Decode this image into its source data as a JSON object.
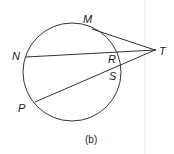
{
  "figure": {
    "caption": "(b)",
    "circle": {
      "cx": 72,
      "cy": 72,
      "r": 49
    },
    "points": {
      "M": {
        "label": "M"
      },
      "N": {
        "label": "N"
      },
      "P": {
        "label": "P"
      },
      "R": {
        "label": "R"
      },
      "S": {
        "label": "S"
      },
      "T": {
        "label": "T"
      }
    },
    "segments": [
      "TM",
      "TN",
      "TP"
    ],
    "colors": {
      "stroke": "#333333",
      "text": "#1a1a1a",
      "divider": "#e8e8e8"
    }
  }
}
